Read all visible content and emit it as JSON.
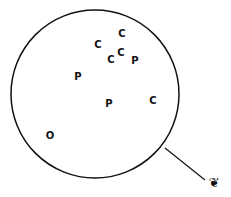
{
  "diagram": {
    "circle": {
      "cx": 95,
      "cy": 94,
      "r": 84,
      "stroke": "#111111"
    },
    "points": [
      {
        "label": "C",
        "x": 122,
        "y": 34
      },
      {
        "label": "C",
        "x": 98,
        "y": 45
      },
      {
        "label": "C",
        "x": 111,
        "y": 60
      },
      {
        "label": "C",
        "x": 121,
        "y": 53
      },
      {
        "label": "P",
        "x": 135,
        "y": 61
      },
      {
        "label": "P",
        "x": 78,
        "y": 77
      },
      {
        "label": "P",
        "x": 109,
        "y": 104
      },
      {
        "label": "C",
        "x": 153,
        "y": 101
      },
      {
        "label": "O",
        "x": 50,
        "y": 136
      }
    ],
    "pointer_line": {
      "x1": 165,
      "y1": 148,
      "x2": 205,
      "y2": 180
    },
    "observer_glyph": "❦"
  }
}
